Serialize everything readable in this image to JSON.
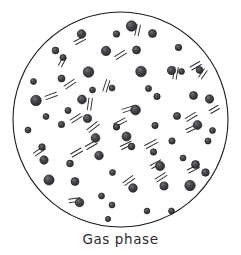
{
  "figure": {
    "caption": "Gas phase",
    "container": {
      "shape": "circle",
      "cx": 120.5,
      "cy": 119.5,
      "r": 107.5,
      "stroke": "#1a1a1a",
      "stroke_width": 1.1,
      "fill": "#ffffff"
    },
    "style": {
      "particle_fill": "#3a3a3f",
      "particle_stroke": "#17171a",
      "particle_highlight": "#6e6e76",
      "motion_line_color": "#2e2e33",
      "background": "#ffffff",
      "caption_color": "#2b2b2b"
    },
    "legend": {
      "particle_meaning": "gas molecule",
      "motion_line_meaning": "motion trail"
    },
    "counts": {
      "particles_total": 62,
      "particles_large": 14,
      "particles_medium": 27,
      "particles_small": 21,
      "motion_trails": 28
    },
    "particles": [
      {
        "x": 131.5,
        "y": 26.0,
        "r": 5.2
      },
      {
        "x": 152.5,
        "y": 33.5,
        "r": 4.0
      },
      {
        "x": 116.5,
        "y": 34.0,
        "r": 3.3
      },
      {
        "x": 81.5,
        "y": 34.0,
        "r": 4.3
      },
      {
        "x": 55.5,
        "y": 50.5,
        "r": 3.4
      },
      {
        "x": 106.0,
        "y": 51.0,
        "r": 4.7
      },
      {
        "x": 136.5,
        "y": 50.0,
        "r": 4.0
      },
      {
        "x": 178.5,
        "y": 47.5,
        "r": 3.3
      },
      {
        "x": 199.5,
        "y": 70.0,
        "r": 3.4
      },
      {
        "x": 171.5,
        "y": 70.5,
        "r": 4.2
      },
      {
        "x": 141.0,
        "y": 71.5,
        "r": 5.3
      },
      {
        "x": 88.5,
        "y": 72.0,
        "r": 5.3
      },
      {
        "x": 61.5,
        "y": 78.5,
        "r": 3.5
      },
      {
        "x": 33.5,
        "y": 81.5,
        "r": 3.0
      },
      {
        "x": 112.0,
        "y": 88.0,
        "r": 3.0
      },
      {
        "x": 157.0,
        "y": 96.5,
        "r": 3.2
      },
      {
        "x": 193.5,
        "y": 95.5,
        "r": 4.0
      },
      {
        "x": 209.5,
        "y": 99.0,
        "r": 4.2
      },
      {
        "x": 36.0,
        "y": 100.5,
        "r": 5.3
      },
      {
        "x": 82.0,
        "y": 99.5,
        "r": 4.4
      },
      {
        "x": 68.0,
        "y": 110.5,
        "r": 3.1
      },
      {
        "x": 87.5,
        "y": 118.5,
        "r": 4.1
      },
      {
        "x": 135.5,
        "y": 110.0,
        "r": 4.9
      },
      {
        "x": 177.0,
        "y": 116.0,
        "r": 3.6
      },
      {
        "x": 61.5,
        "y": 124.5,
        "r": 3.2
      },
      {
        "x": 116.5,
        "y": 127.0,
        "r": 3.1
      },
      {
        "x": 155.0,
        "y": 125.5,
        "r": 3.2
      },
      {
        "x": 197.5,
        "y": 125.0,
        "r": 4.4
      },
      {
        "x": 28.0,
        "y": 130.0,
        "r": 3.0
      },
      {
        "x": 116.5,
        "y": 127.0,
        "r": 3.0
      },
      {
        "x": 95.5,
        "y": 138.0,
        "r": 4.4
      },
      {
        "x": 126.5,
        "y": 136.5,
        "r": 4.5
      },
      {
        "x": 172.0,
        "y": 141.0,
        "r": 3.2
      },
      {
        "x": 208.0,
        "y": 141.0,
        "r": 3.1
      },
      {
        "x": 42.0,
        "y": 147.0,
        "r": 3.3
      },
      {
        "x": 131.5,
        "y": 146.5,
        "r": 3.4
      },
      {
        "x": 153.5,
        "y": 152.0,
        "r": 3.2
      },
      {
        "x": 99.0,
        "y": 155.5,
        "r": 4.3
      },
      {
        "x": 183.0,
        "y": 158.0,
        "r": 3.0
      },
      {
        "x": 44.0,
        "y": 160.0,
        "r": 4.2
      },
      {
        "x": 70.0,
        "y": 163.5,
        "r": 3.4
      },
      {
        "x": 160.0,
        "y": 166.0,
        "r": 4.6
      },
      {
        "x": 195.5,
        "y": 164.5,
        "r": 4.0
      },
      {
        "x": 112.5,
        "y": 172.5,
        "r": 3.0
      },
      {
        "x": 205.5,
        "y": 172.5,
        "r": 3.8
      },
      {
        "x": 49.0,
        "y": 180.0,
        "r": 5.1
      },
      {
        "x": 75.0,
        "y": 181.5,
        "r": 4.0
      },
      {
        "x": 133.0,
        "y": 188.0,
        "r": 4.3
      },
      {
        "x": 164.0,
        "y": 186.0,
        "r": 4.1
      },
      {
        "x": 190.0,
        "y": 185.5,
        "r": 5.2
      },
      {
        "x": 101.5,
        "y": 196.0,
        "r": 3.0
      },
      {
        "x": 79.5,
        "y": 202.5,
        "r": 4.3
      },
      {
        "x": 112.0,
        "y": 205.0,
        "r": 3.0
      },
      {
        "x": 147.0,
        "y": 211.0,
        "r": 2.9
      },
      {
        "x": 171.5,
        "y": 211.0,
        "r": 3.0
      },
      {
        "x": 108.0,
        "y": 219.0,
        "r": 2.7
      },
      {
        "x": 63.0,
        "y": 57.5,
        "r": 3.1
      },
      {
        "x": 212.5,
        "y": 130.5,
        "r": 3.0
      },
      {
        "x": 46.0,
        "y": 116.5,
        "r": 3.0
      },
      {
        "x": 148.5,
        "y": 88.5,
        "r": 3.1
      },
      {
        "x": 181.5,
        "y": 71.5,
        "r": 3.0
      },
      {
        "x": 92.5,
        "y": 90.0,
        "r": 3.0
      }
    ],
    "motion_trails": [
      {
        "x": 75.0,
        "y": 43.0,
        "angle": -28,
        "len": 11
      },
      {
        "x": 136.5,
        "y": 35.5,
        "angle": -78,
        "len": 11
      },
      {
        "x": 115.5,
        "y": 58.0,
        "angle": -32,
        "len": 12
      },
      {
        "x": 191.0,
        "y": 68.5,
        "angle": -30,
        "len": 11
      },
      {
        "x": 174.5,
        "y": 79.0,
        "angle": -80,
        "len": 12
      },
      {
        "x": 104.5,
        "y": 91.5,
        "angle": -72,
        "len": 12
      },
      {
        "x": 65.0,
        "y": 87.5,
        "angle": -34,
        "len": 12
      },
      {
        "x": 45.5,
        "y": 98.0,
        "angle": -20,
        "len": 12
      },
      {
        "x": 89.0,
        "y": 110.0,
        "angle": -82,
        "len": 12
      },
      {
        "x": 71.0,
        "y": 121.5,
        "angle": -33,
        "len": 12
      },
      {
        "x": 122.5,
        "y": 111.0,
        "angle": -18,
        "len": 13
      },
      {
        "x": 186.0,
        "y": 120.0,
        "angle": -31,
        "len": 12
      },
      {
        "x": 114.5,
        "y": 125.5,
        "angle": -28,
        "len": 13
      },
      {
        "x": 186.5,
        "y": 131.0,
        "angle": -25,
        "len": 12
      },
      {
        "x": 88.0,
        "y": 131.0,
        "angle": -38,
        "len": 13
      },
      {
        "x": 145.5,
        "y": 147.0,
        "angle": -28,
        "len": 13
      },
      {
        "x": 121.0,
        "y": 148.0,
        "angle": -26,
        "len": 12
      },
      {
        "x": 34.5,
        "y": 154.5,
        "angle": -35,
        "len": 12
      },
      {
        "x": 71.5,
        "y": 155.5,
        "angle": -30,
        "len": 12
      },
      {
        "x": 151.0,
        "y": 167.0,
        "angle": -28,
        "len": 12
      },
      {
        "x": 188.0,
        "y": 171.5,
        "angle": -27,
        "len": 12
      },
      {
        "x": 124.0,
        "y": 184.0,
        "angle": -36,
        "len": 12
      },
      {
        "x": 156.0,
        "y": 180.5,
        "angle": -33,
        "len": 12
      },
      {
        "x": 69.0,
        "y": 201.0,
        "angle": -8,
        "len": 11
      },
      {
        "x": 86.0,
        "y": 148.0,
        "angle": -30,
        "len": 12
      },
      {
        "x": 200.0,
        "y": 78.0,
        "angle": -55,
        "len": 10
      },
      {
        "x": 60.0,
        "y": 66.0,
        "angle": -62,
        "len": 10
      },
      {
        "x": 210.0,
        "y": 112.0,
        "angle": -30,
        "len": 10
      }
    ]
  }
}
